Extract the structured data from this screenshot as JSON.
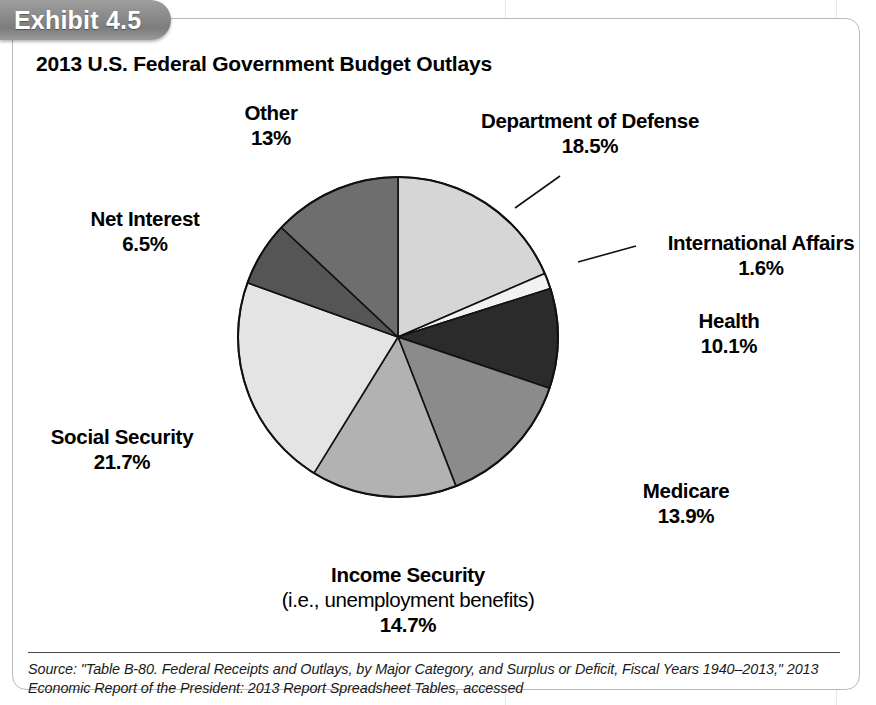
{
  "exhibit": {
    "tab_label": "Exhibit 4.5"
  },
  "chart_title": "2013 U.S. Federal Government Budget Outlays",
  "source_note": "Source: \"Table B-80. Federal Receipts and Outlays, by Major Category, and Surplus or Deficit, Fiscal Years 1940–2013,\" 2013 Economic Report of the President: 2013 Report Spreadsheet Tables, accessed",
  "labels": {
    "other": {
      "name": "Other",
      "pct": "13%"
    },
    "defense": {
      "name": "Department of Defense",
      "pct": "18.5%"
    },
    "net_interest": {
      "name": "Net Interest",
      "pct": "6.5%"
    },
    "intl_affairs": {
      "name": "International Affairs",
      "pct": "1.6%"
    },
    "health": {
      "name": "Health",
      "pct": "10.1%"
    },
    "social_security": {
      "name": "Social Security",
      "pct": "21.7%"
    },
    "medicare": {
      "name": "Medicare",
      "pct": "13.9%"
    },
    "income_security": {
      "name": "Income Security",
      "sub": "(i.e., unemployment benefits)",
      "pct": "14.7%"
    }
  },
  "chart_data": {
    "type": "pie",
    "title": "2013 U.S. Federal Government Budget Outlays",
    "units": "percent of total outlays",
    "start_angle_deg": 0,
    "direction": "clockwise",
    "legend": "none (labels placed around pie with leader lines)",
    "categories": [
      "Department of Defense",
      "International Affairs",
      "Health",
      "Medicare",
      "Income Security",
      "Social Security",
      "Net Interest",
      "Other"
    ],
    "values": [
      18.5,
      1.6,
      10.1,
      13.9,
      14.7,
      21.7,
      6.5,
      13.0
    ],
    "slices": [
      {
        "label": "Department of Defense",
        "value": 18.5,
        "color": "#d6d6d6"
      },
      {
        "label": "International Affairs",
        "value": 1.6,
        "color": "#f2f2f2"
      },
      {
        "label": "Health",
        "value": 10.1,
        "color": "#2b2b2b"
      },
      {
        "label": "Medicare",
        "value": 13.9,
        "color": "#8b8b8b"
      },
      {
        "label": "Income Security",
        "value": 14.7,
        "color": "#b2b2b2"
      },
      {
        "label": "Social Security",
        "value": 21.7,
        "color": "#e4e4e4"
      },
      {
        "label": "Net Interest",
        "value": 6.5,
        "color": "#555555"
      },
      {
        "label": "Other",
        "value": 13.0,
        "color": "#6e6e6e"
      }
    ],
    "total": 100.0
  },
  "geometry": {
    "center_x": 398,
    "center_y": 337,
    "radius": 160
  }
}
